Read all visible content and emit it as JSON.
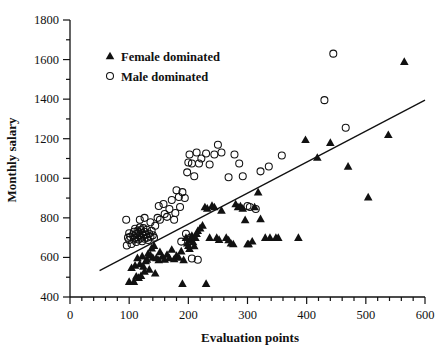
{
  "chart_data": {
    "type": "scatter",
    "title": "",
    "xlabel": "Evaluation points",
    "ylabel": "Monthly salary",
    "xlim": [
      0,
      600
    ],
    "ylim": [
      400,
      1800
    ],
    "xticks": [
      0,
      100,
      200,
      300,
      400,
      500,
      600
    ],
    "yticks": [
      400,
      600,
      800,
      1000,
      1200,
      1400,
      1600,
      1800
    ],
    "x_minor_step": 20,
    "y_minor_step": 100,
    "grid": false,
    "legend_position": "upper-left",
    "legend": [
      {
        "label": "Female dominated",
        "marker": "filled-triangle",
        "color": "#111111"
      },
      {
        "label": "Male dominated",
        "marker": "open-circle",
        "color": "#111111"
      }
    ],
    "trendline": {
      "x": [
        50,
        600
      ],
      "y": [
        533,
        1395
      ],
      "color": "#111111"
    },
    "series": [
      {
        "name": "Female dominated",
        "marker": "filled-triangle",
        "points": [
          [
            100,
            478
          ],
          [
            108,
            478
          ],
          [
            112,
            505
          ],
          [
            116,
            498
          ],
          [
            120,
            508
          ],
          [
            104,
            548
          ],
          [
            110,
            560
          ],
          [
            118,
            567
          ],
          [
            124,
            555
          ],
          [
            128,
            583
          ],
          [
            114,
            598
          ],
          [
            122,
            607
          ],
          [
            130,
            590
          ],
          [
            132,
            620
          ],
          [
            136,
            612
          ],
          [
            140,
            600
          ],
          [
            138,
            647
          ],
          [
            142,
            660
          ],
          [
            146,
            598
          ],
          [
            150,
            588
          ],
          [
            152,
            628
          ],
          [
            134,
            540
          ],
          [
            126,
            530
          ],
          [
            144,
            520
          ],
          [
            156,
            605
          ],
          [
            160,
            590
          ],
          [
            164,
            615
          ],
          [
            168,
            598
          ],
          [
            172,
            640
          ],
          [
            176,
            592
          ],
          [
            180,
            610
          ],
          [
            184,
            600
          ],
          [
            188,
            632
          ],
          [
            192,
            588
          ],
          [
            190,
            468
          ],
          [
            196,
            700
          ],
          [
            198,
            672
          ],
          [
            200,
            660
          ],
          [
            202,
            645
          ],
          [
            204,
            690
          ],
          [
            206,
            710
          ],
          [
            208,
            678
          ],
          [
            210,
            658
          ],
          [
            212,
            700
          ],
          [
            214,
            720
          ],
          [
            216,
            735
          ],
          [
            220,
            748
          ],
          [
            224,
            762
          ],
          [
            228,
            855
          ],
          [
            232,
            848
          ],
          [
            236,
            700
          ],
          [
            240,
            862
          ],
          [
            244,
            855
          ],
          [
            248,
            700
          ],
          [
            252,
            690
          ],
          [
            256,
            838
          ],
          [
            230,
            468
          ],
          [
            264,
            700
          ],
          [
            268,
            688
          ],
          [
            272,
            672
          ],
          [
            276,
            668
          ],
          [
            280,
            870
          ],
          [
            284,
            855
          ],
          [
            288,
            860
          ],
          [
            292,
            848
          ],
          [
            296,
            790
          ],
          [
            300,
            668
          ],
          [
            302,
            668
          ],
          [
            308,
            682
          ],
          [
            312,
            855
          ],
          [
            318,
            930
          ],
          [
            322,
            795
          ],
          [
            330,
            700
          ],
          [
            338,
            700
          ],
          [
            348,
            700
          ],
          [
            352,
            700
          ],
          [
            386,
            700
          ],
          [
            398,
            1195
          ],
          [
            418,
            1105
          ],
          [
            440,
            1180
          ],
          [
            470,
            1060
          ],
          [
            504,
            905
          ],
          [
            538,
            1220
          ],
          [
            565,
            1590
          ]
        ]
      },
      {
        "name": "Male dominated",
        "marker": "open-circle",
        "points": [
          [
            96,
            660
          ],
          [
            98,
            700
          ],
          [
            100,
            688
          ],
          [
            100,
            722
          ],
          [
            102,
            705
          ],
          [
            104,
            668
          ],
          [
            106,
            712
          ],
          [
            108,
            730
          ],
          [
            108,
            690
          ],
          [
            110,
            700
          ],
          [
            110,
            745
          ],
          [
            112,
            678
          ],
          [
            112,
            718
          ],
          [
            114,
            702
          ],
          [
            114,
            735
          ],
          [
            116,
            690
          ],
          [
            116,
            728
          ],
          [
            118,
            712
          ],
          [
            118,
            752
          ],
          [
            120,
            700
          ],
          [
            120,
            738
          ],
          [
            122,
            682
          ],
          [
            122,
            722
          ],
          [
            124,
            710
          ],
          [
            124,
            748
          ],
          [
            126,
            695
          ],
          [
            126,
            730
          ],
          [
            128,
            715
          ],
          [
            130,
            700
          ],
          [
            130,
            740
          ],
          [
            132,
            688
          ],
          [
            134,
            720
          ],
          [
            136,
            705
          ],
          [
            138,
            735
          ],
          [
            140,
            712
          ],
          [
            142,
            700
          ],
          [
            95,
            790
          ],
          [
            118,
            790
          ],
          [
            126,
            800
          ],
          [
            136,
            778
          ],
          [
            144,
            760
          ],
          [
            148,
            800
          ],
          [
            152,
            790
          ],
          [
            150,
            860
          ],
          [
            158,
            870
          ],
          [
            160,
            820
          ],
          [
            164,
            805
          ],
          [
            168,
            845
          ],
          [
            172,
            890
          ],
          [
            176,
            790
          ],
          [
            178,
            825
          ],
          [
            180,
            940
          ],
          [
            184,
            905
          ],
          [
            186,
            855
          ],
          [
            190,
            930
          ],
          [
            194,
            900
          ],
          [
            198,
            1030
          ],
          [
            200,
            1080
          ],
          [
            202,
            1120
          ],
          [
            206,
            1075
          ],
          [
            210,
            1010
          ],
          [
            214,
            1130
          ],
          [
            218,
            1075
          ],
          [
            222,
            1100
          ],
          [
            196,
            720
          ],
          [
            204,
            700
          ],
          [
            188,
            680
          ],
          [
            206,
            595
          ],
          [
            216,
            588
          ],
          [
            230,
            1125
          ],
          [
            236,
            1070
          ],
          [
            244,
            1120
          ],
          [
            250,
            1170
          ],
          [
            256,
            1130
          ],
          [
            268,
            1005
          ],
          [
            278,
            1120
          ],
          [
            286,
            1075
          ],
          [
            292,
            1010
          ],
          [
            300,
            860
          ],
          [
            304,
            855
          ],
          [
            314,
            845
          ],
          [
            322,
            1035
          ],
          [
            336,
            1060
          ],
          [
            358,
            1115
          ],
          [
            430,
            1395
          ],
          [
            445,
            1630
          ],
          [
            466,
            1255
          ]
        ]
      }
    ]
  },
  "axes": {
    "x_label": "Evaluation points",
    "y_label": "Monthly salary"
  }
}
